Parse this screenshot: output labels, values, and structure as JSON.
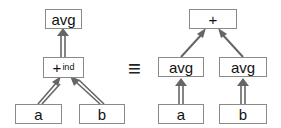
{
  "diagram": {
    "equivalence_symbol": "≡",
    "left": {
      "root": {
        "label": "avg"
      },
      "op": {
        "label": "+",
        "subscript": "ind"
      },
      "leaves": [
        {
          "label": "a"
        },
        {
          "label": "b"
        }
      ],
      "edge_style": "double"
    },
    "right": {
      "root": {
        "label": "+"
      },
      "mids": [
        {
          "label": "avg"
        },
        {
          "label": "avg"
        }
      ],
      "leaves": [
        {
          "label": "a"
        },
        {
          "label": "b"
        }
      ],
      "edge_style_top": "single",
      "edge_style_bottom": "double"
    },
    "colors": {
      "arrow": "#666666",
      "border": "#8a8a8a"
    }
  }
}
